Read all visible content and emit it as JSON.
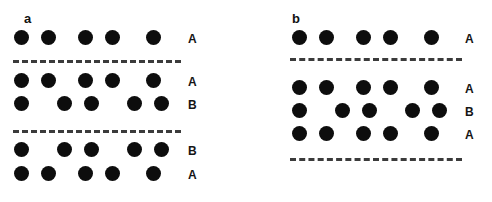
{
  "figure": {
    "background_color": "#ffffff",
    "dot_color": "#0d0d0d",
    "line_color": "#3b3b3b",
    "panels": [
      {
        "letter": "a",
        "letter_x": 24,
        "letter_y": 12,
        "label_x": 188,
        "line_x": 13,
        "line_width": 168,
        "rows": [
          {
            "label": "A",
            "y": 30,
            "dot_size": 15,
            "dots_x": [
              14,
              41,
              78,
              105,
              146
            ]
          },
          {
            "label": "A",
            "y": 73,
            "dot_size": 15,
            "dots_x": [
              14,
              41,
              78,
              105,
              146
            ]
          },
          {
            "label": "B",
            "y": 96,
            "dot_size": 15,
            "dots_x": [
              14,
              57,
              84,
              127,
              154
            ]
          },
          {
            "label": "B",
            "y": 142,
            "dot_size": 15,
            "dots_x": [
              14,
              57,
              84,
              127,
              154
            ]
          },
          {
            "label": "A",
            "y": 166,
            "dot_size": 15,
            "dots_x": [
              14,
              41,
              78,
              105,
              146
            ]
          }
        ],
        "lines": [
          {
            "y": 60,
            "x": 13,
            "width": 168
          },
          {
            "y": 130,
            "x": 13,
            "width": 168
          }
        ]
      },
      {
        "letter": "b",
        "letter_x": 292,
        "letter_y": 12,
        "label_x": 465,
        "line_x": 290,
        "line_width": 172,
        "rows": [
          {
            "label": "A",
            "y": 30,
            "dot_size": 15,
            "dots_x": [
              292,
              319,
              356,
              383,
              424
            ]
          },
          {
            "label": "A",
            "y": 80,
            "dot_size": 15,
            "dots_x": [
              292,
              319,
              356,
              383,
              424
            ]
          },
          {
            "label": "B",
            "y": 103,
            "dot_size": 15,
            "dots_x": [
              292,
              335,
              362,
              405,
              432
            ]
          },
          {
            "label": "A",
            "y": 126,
            "dot_size": 15,
            "dots_x": [
              292,
              319,
              356,
              383,
              424
            ]
          }
        ],
        "lines": [
          {
            "y": 58,
            "x": 290,
            "width": 172
          },
          {
            "y": 158,
            "x": 290,
            "width": 172
          }
        ]
      }
    ]
  }
}
